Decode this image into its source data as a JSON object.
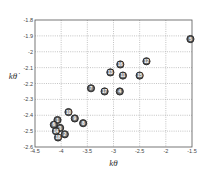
{
  "chart_data": {
    "type": "scatter",
    "title": "",
    "xlabel": "kθ",
    "ylabel": "kθ̇",
    "xlim": [
      -4.5,
      -1.5
    ],
    "ylim": [
      -2.6,
      -1.8
    ],
    "grid": true,
    "legend": null,
    "x_ticks": [
      "-4.5",
      "-4",
      "-3.5",
      "-3",
      "-2.5",
      "-2",
      "-1.5"
    ],
    "y_ticks": [
      "-1.8",
      "-1.9",
      "-2",
      "-2.1",
      "-2.2",
      "-2.3",
      "-2.4",
      "-2.5",
      "-2.6"
    ],
    "marker": "numbered circle",
    "points": [
      {
        "label": "1",
        "x": -4.07,
        "y": -2.43
      },
      {
        "label": "2",
        "x": -3.93,
        "y": -2.52
      },
      {
        "label": "3",
        "x": -4.02,
        "y": -2.48
      },
      {
        "label": "4",
        "x": -2.88,
        "y": -2.25
      },
      {
        "label": "5",
        "x": -1.53,
        "y": -1.92
      },
      {
        "label": "6",
        "x": -4.14,
        "y": -2.46
      },
      {
        "label": "7",
        "x": -3.43,
        "y": -2.23
      },
      {
        "label": "8",
        "x": -3.58,
        "y": -2.45
      },
      {
        "label": "9",
        "x": -3.74,
        "y": -2.42
      },
      {
        "label": "10",
        "x": -3.86,
        "y": -2.38
      },
      {
        "label": "11",
        "x": -2.82,
        "y": -2.15
      },
      {
        "label": "12",
        "x": -2.37,
        "y": -2.06
      },
      {
        "label": "13",
        "x": -3.06,
        "y": -2.13
      },
      {
        "label": "14",
        "x": -4.1,
        "y": -2.5
      },
      {
        "label": "15",
        "x": -2.5,
        "y": -2.15
      },
      {
        "label": "16",
        "x": -2.87,
        "y": -2.08
      },
      {
        "label": "17",
        "x": -3.17,
        "y": -2.25
      },
      {
        "label": "18",
        "x": -4.06,
        "y": -2.54
      }
    ]
  }
}
